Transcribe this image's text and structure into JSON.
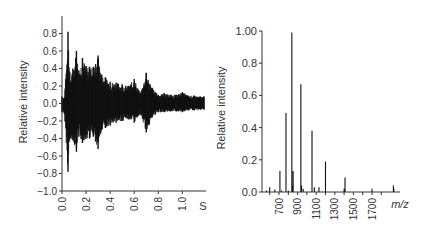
{
  "chart_data": [
    {
      "type": "line",
      "panel": "left",
      "title": "",
      "xlabel": "",
      "x_unit_label": "S",
      "ylabel": "Relative intensity",
      "xlim": [
        0.0,
        1.2
      ],
      "ylim": [
        -1.0,
        1.0
      ],
      "x_ticks": [
        0.0,
        0.2,
        0.4,
        0.6,
        0.8,
        1.0
      ],
      "x_tick_labels": [
        "0.0",
        "0.2",
        "0.4",
        "0.6",
        "0.8",
        "1.0"
      ],
      "y_ticks": [
        0.8,
        0.6,
        0.4,
        0.2,
        0.0,
        -0.2,
        -0.4,
        -0.6,
        -0.8,
        -1.0
      ],
      "y_tick_labels": [
        "0.8",
        "0.6",
        "0.4",
        "0.2",
        "0.0",
        "−0.2",
        "−0.4",
        "−0.6",
        "−0.8",
        "−1.0"
      ],
      "grid": false,
      "legend": null,
      "description": "Time-domain transient (FID-like) signal, decaying oscillation envelope",
      "envelope": {
        "x": [
          0.0,
          0.02,
          0.05,
          0.07,
          0.09,
          0.12,
          0.14,
          0.17,
          0.2,
          0.23,
          0.26,
          0.3,
          0.33,
          0.36,
          0.4,
          0.45,
          0.5,
          0.55,
          0.6,
          0.65,
          0.7,
          0.75,
          0.8,
          0.85,
          0.9,
          0.95,
          1.0,
          1.05,
          1.1,
          1.15,
          1.18
        ],
        "upper": [
          0.08,
          0.07,
          0.82,
          0.25,
          0.4,
          0.6,
          0.38,
          0.52,
          0.43,
          0.42,
          0.42,
          0.55,
          0.33,
          0.3,
          0.25,
          0.24,
          0.22,
          0.2,
          0.28,
          0.12,
          0.35,
          0.18,
          0.1,
          0.12,
          0.1,
          0.1,
          0.13,
          0.09,
          0.09,
          0.08,
          0.08
        ],
        "lower": [
          -0.1,
          -0.12,
          -0.78,
          -0.4,
          -0.42,
          -0.55,
          -0.38,
          -0.45,
          -0.4,
          -0.4,
          -0.38,
          -0.52,
          -0.3,
          -0.28,
          -0.25,
          -0.22,
          -0.2,
          -0.18,
          -0.22,
          -0.12,
          -0.33,
          -0.16,
          -0.1,
          -0.1,
          -0.09,
          -0.09,
          -0.1,
          -0.08,
          -0.08,
          -0.07,
          -0.07
        ]
      }
    },
    {
      "type": "bar",
      "panel": "right",
      "subtype": "stick-spectrum",
      "title": "",
      "xlabel": "m/z",
      "ylabel": "Relative intensity",
      "xlim": [
        500,
        2000
      ],
      "ylim": [
        0.0,
        1.0
      ],
      "x_ticks": [
        700,
        900,
        1100,
        1300,
        1500,
        1700
      ],
      "x_tick_labels": [
        "700",
        "900",
        "1100",
        "1300",
        "1500",
        "1700"
      ],
      "y_ticks": [
        0.0,
        0.2,
        0.4,
        0.6,
        0.8,
        1.0
      ],
      "y_tick_labels": [
        "0.0",
        "0.2",
        "0.4",
        "0.6",
        "0.8",
        "1.00"
      ],
      "grid": false,
      "legend": null,
      "peaks": {
        "mz": [
          565,
          600,
          655,
          710,
          728,
          775,
          800,
          838,
          843,
          852,
          935,
          942,
          960,
          1055,
          1080,
          1130,
          1200,
          1400,
          1410,
          1700,
          1930,
          1935
        ],
        "intensity": [
          0.01,
          0.03,
          0.015,
          0.13,
          0.01,
          0.49,
          0.01,
          0.99,
          0.04,
          0.13,
          0.67,
          0.04,
          0.02,
          0.38,
          0.03,
          0.03,
          0.19,
          0.02,
          0.09,
          0.02,
          0.04,
          0.02
        ]
      }
    }
  ],
  "layout": {
    "left": {
      "x0": 62,
      "x1": 206,
      "y_top": 16,
      "y_bottom": 191,
      "xmax_px": 204
    },
    "right": {
      "x0": 262,
      "x1": 400,
      "y_top": 31,
      "y_bottom": 192
    }
  },
  "colors": {
    "axis": "#333333",
    "trace": "#111111",
    "text": "#333333",
    "background": "#ffffff"
  }
}
